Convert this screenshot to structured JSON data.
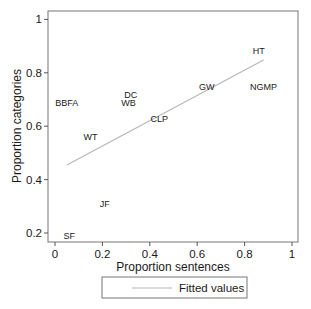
{
  "chart_data": {
    "type": "scatter",
    "title": "",
    "xlabel": "Proportion sentences",
    "ylabel": "Proportion categories",
    "xlim": [
      0,
      1
    ],
    "ylim": [
      0.2,
      1
    ],
    "xticks": [
      "0",
      "0.2",
      "0.4",
      "0.6",
      "0.8",
      "1"
    ],
    "yticks": [
      "0.2",
      "0.4",
      "0.6",
      "0.8",
      "1"
    ],
    "grid": false,
    "marker": "label-only",
    "points": [
      {
        "label": "BBFA",
        "x": 0.05,
        "y": 0.69
      },
      {
        "label": "DC",
        "x": 0.32,
        "y": 0.72
      },
      {
        "label": "WB",
        "x": 0.31,
        "y": 0.69
      },
      {
        "label": "CLP",
        "x": 0.44,
        "y": 0.63
      },
      {
        "label": "WT",
        "x": 0.15,
        "y": 0.56
      },
      {
        "label": "JF",
        "x": 0.21,
        "y": 0.31
      },
      {
        "label": "SF",
        "x": 0.06,
        "y": 0.19
      },
      {
        "label": "GW",
        "x": 0.64,
        "y": 0.75
      },
      {
        "label": "HT",
        "x": 0.86,
        "y": 0.885
      },
      {
        "label": "NGMP",
        "x": 0.88,
        "y": 0.75
      }
    ],
    "series": [
      {
        "name": "Fitted values",
        "type": "line",
        "x": [
          0.05,
          0.88
        ],
        "y": [
          0.455,
          0.848
        ],
        "color": "#b8b8b8"
      }
    ],
    "legend": {
      "position": "bottom",
      "entries": [
        "Fitted values"
      ]
    }
  },
  "colors": {
    "axis": "#555555",
    "frame": "#777777",
    "fit_line": "#b8b8b8",
    "text": "#1a1a1a"
  }
}
